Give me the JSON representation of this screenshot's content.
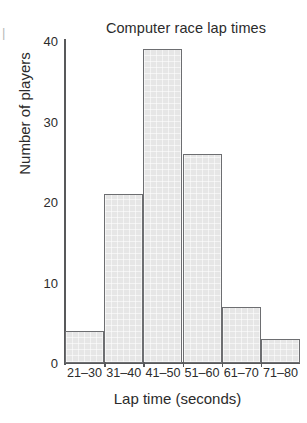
{
  "chart_data": {
    "type": "bar",
    "title": "Computer race lap times",
    "xlabel": "Lap time (seconds)",
    "ylabel": "Number of players",
    "categories": [
      "21–30",
      "31–40",
      "41–50",
      "51–60",
      "61–70",
      "71–80"
    ],
    "values": [
      4,
      21,
      39,
      26,
      7,
      3
    ],
    "ylim": [
      0,
      40
    ],
    "yticks": [
      0,
      10,
      20,
      30,
      40
    ],
    "ytick_labels": [
      "0",
      "10",
      "20",
      "30",
      "40"
    ],
    "grid": false,
    "legend": null,
    "bar_fill": "#e6e6e6",
    "bar_edge": "#6d6e71",
    "axis_color": "#58595b",
    "text_color": "#2b2b2b"
  },
  "edge_mark": "|"
}
